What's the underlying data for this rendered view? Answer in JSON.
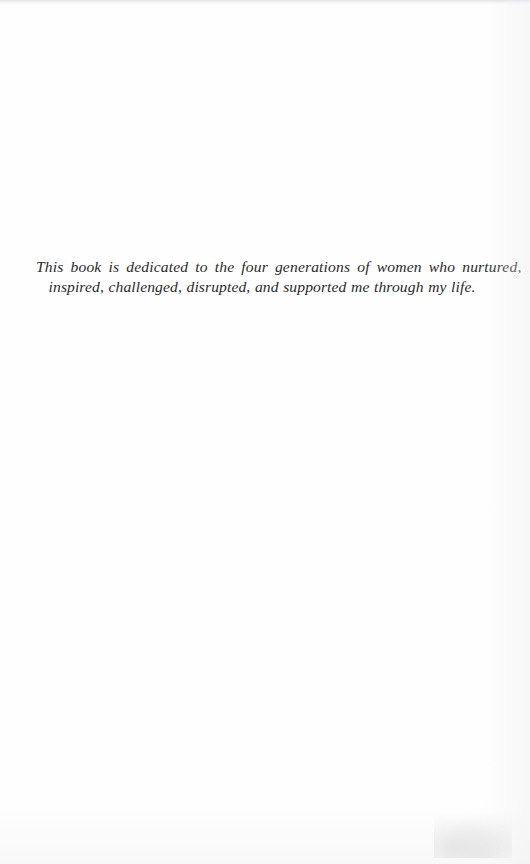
{
  "page": {
    "kind": "book-dedication-page",
    "width": 530,
    "height": 864,
    "background_color": "#fefefe",
    "ink_color": "#2b2a29"
  },
  "dedication": {
    "full_text": "This book is dedicated to the four generations of women who nurtured, inspired, challenged, disrupted, and supported me through my life.",
    "lines": [
      {
        "text": "This book is dedicated to the four generations of women who nurtured,",
        "alignment": "justified"
      },
      {
        "text": "inspired, challenged, disrupted, and supported me through my life.",
        "alignment": "centered"
      }
    ]
  }
}
